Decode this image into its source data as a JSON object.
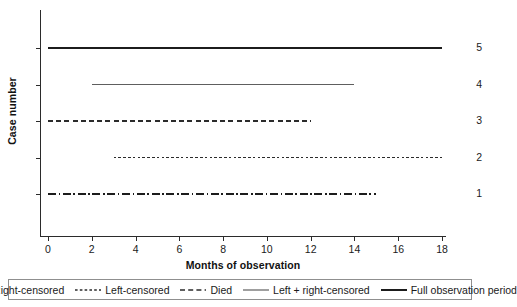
{
  "chart_data": {
    "type": "line",
    "title": "",
    "xlabel": "Months of observation",
    "ylabel": "Case number",
    "xlim": [
      0,
      18
    ],
    "ylim": [
      0,
      5.6
    ],
    "grid": false,
    "xticks": [
      0,
      2,
      4,
      6,
      8,
      10,
      12,
      14,
      16,
      18
    ],
    "xtick_labels": [
      "0",
      "2",
      "4",
      "6",
      "8",
      "10",
      "12",
      "14",
      "16",
      "18"
    ],
    "yticks": [
      1,
      2,
      3,
      4,
      5
    ],
    "ytick_labels": [
      "1",
      "2",
      "3",
      "4",
      "5"
    ],
    "legend_position": "bottom",
    "series": [
      {
        "name": "Full observation period",
        "case": 5,
        "y": 5,
        "x_start": 0,
        "x_end": 18,
        "style": "solid",
        "color": "#1c1c1c",
        "width": 2.0
      },
      {
        "name": "Left + right-censored",
        "case": 4,
        "y": 4,
        "x_start": 2,
        "x_end": 14,
        "style": "solid",
        "color": "#5e5e5e",
        "width": 1.1
      },
      {
        "name": "Died",
        "case": 3,
        "y": 3,
        "x_start": 0,
        "x_end": 12,
        "style": "dashed",
        "color": "#2b2b2b",
        "width": 1.6
      },
      {
        "name": "Left-censored",
        "case": 2,
        "y": 2,
        "x_start": 3,
        "x_end": 18,
        "style": "fine-dashed",
        "color": "#2b2b2b",
        "width": 1.4
      },
      {
        "name": "Right-censored",
        "case": 1,
        "y": 1,
        "x_start": 0,
        "x_end": 15,
        "style": "dash-dot",
        "color": "#1c1c1c",
        "width": 1.8
      }
    ]
  },
  "legend": {
    "items": [
      {
        "label": "Right-censored",
        "style": "dash-dot",
        "color": "#1c1c1c",
        "width": 1.8
      },
      {
        "label": "Left-censored",
        "style": "fine-dashed",
        "color": "#2b2b2b",
        "width": 1.4
      },
      {
        "label": "Died",
        "style": "dashed",
        "color": "#2b2b2b",
        "width": 1.6
      },
      {
        "label": "Left + right-censored",
        "style": "solid",
        "color": "#5e5e5e",
        "width": 1.2
      },
      {
        "label": "Full observation period",
        "style": "solid",
        "color": "#1c1c1c",
        "width": 2.0
      }
    ]
  }
}
